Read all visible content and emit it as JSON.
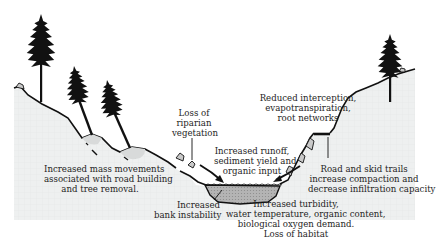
{
  "diagram": {
    "colors": {
      "ground_fill": "#eef0f0",
      "outline": "#111111",
      "water_fill": "#a9a9a9",
      "tree": "#111111",
      "background": "#ffffff"
    },
    "labels": {
      "loss_riparian": [
        "Loss of",
        "riparian",
        "vegetation"
      ],
      "reduced_interception": [
        "Reduced interception,",
        "evapotranspiration,",
        "root networks"
      ],
      "increased_runoff": [
        "Increased runoff,",
        "sediment yield and",
        "organic input"
      ],
      "mass_movements": [
        "Increased mass movements",
        "associated with road building",
        "and tree removal."
      ],
      "road_skid_trails": [
        "Road and skid trails",
        "increase compaction and",
        "decrease infiltration capacity"
      ],
      "bank_instability": [
        "Increased",
        "bank instability"
      ],
      "turbidity": [
        "Increased turbidity,",
        "water temperature, organic content,",
        "biological oxygen demand.",
        "Loss of habitat"
      ]
    },
    "icons": [
      "pine-tree-icon",
      "rock-icon",
      "arrow-icon",
      "stream-icon",
      "road-icon"
    ]
  }
}
